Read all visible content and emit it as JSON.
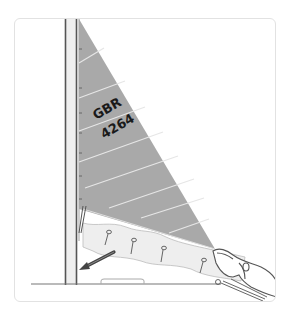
{
  "figure": {
    "kind": "instructional-illustration",
    "sail": {
      "number_line_1": "GBR",
      "number_line_2": "4264",
      "fill_color": "#a9a9a9",
      "seam_color": "#e6e6e6"
    },
    "reef_ties_count": 4,
    "arrow_direction": "down-left toward tack",
    "colors": {
      "card_border": "#e2e2e2",
      "mast_line": "#555555",
      "mast_fill": "#efefef",
      "outline": "#6a6a6a",
      "reef_fill": "#eeeeee",
      "arrow": "#444444"
    }
  }
}
